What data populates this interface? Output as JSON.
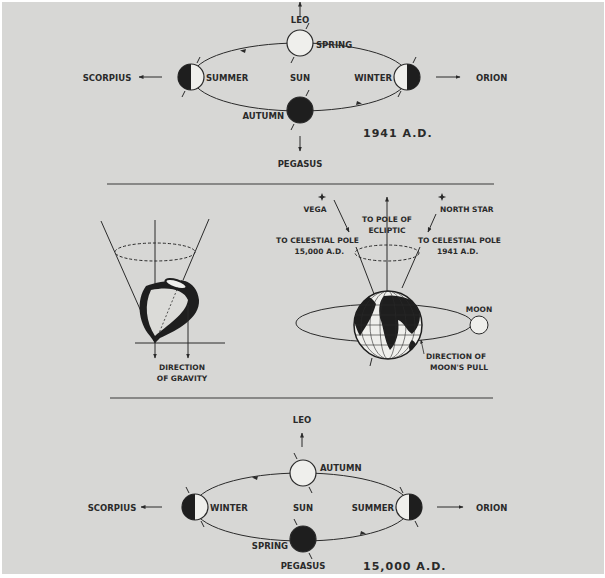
{
  "colors": {
    "background": "#d7d7d5",
    "border": "#ffffff",
    "ink": "#2a2a2a",
    "light_fill": "#efefec"
  },
  "top_diagram": {
    "year_label": "1941 A.D.",
    "center_label": "SUN",
    "constellations": {
      "top": "LEO",
      "left": "SCORPIUS",
      "right": "ORION",
      "bottom": "PEGASUS"
    },
    "seasons": {
      "top": "SPRING",
      "left": "SUMMER",
      "right": "WINTER",
      "bottom": "AUTUMN"
    }
  },
  "middle_diagram": {
    "top_labels": {
      "direction": "DIRECTION",
      "of_gravity": "OF GRAVITY"
    },
    "earth_labels": {
      "vega": "VEGA",
      "north_star": "NORTH STAR",
      "pole_ecliptic_1": "TO POLE OF",
      "pole_ecliptic_2": "ECLIPTIC",
      "celestial_15000_1": "TO CELESTIAL POLE",
      "celestial_15000_2": "15,000 A.D.",
      "celestial_1941_1": "TO CELESTIAL POLE",
      "celestial_1941_2": "1941 A.D.",
      "moon": "MOON",
      "moon_pull_1": "DIRECTION OF",
      "moon_pull_2": "MOON'S PULL"
    }
  },
  "bottom_diagram": {
    "year_label": "15,000 A.D.",
    "center_label": "SUN",
    "constellations": {
      "top": "LEO",
      "left": "SCORPIUS",
      "right": "ORION",
      "bottom": "PEGASUS"
    },
    "seasons": {
      "top": "AUTUMN",
      "left": "WINTER",
      "right": "SUMMER",
      "bottom": "SPRING"
    }
  }
}
